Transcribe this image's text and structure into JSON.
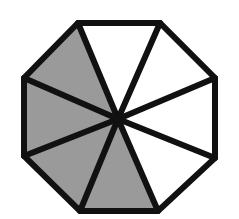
{
  "figure": {
    "shape": "regular-octagon",
    "center": [
      118,
      119
    ],
    "vertices": [
      [
        78,
        23
      ],
      [
        160,
        23
      ],
      [
        215,
        78
      ],
      [
        215,
        158
      ],
      [
        158,
        211
      ],
      [
        80,
        211
      ],
      [
        24,
        156
      ],
      [
        24,
        78
      ]
    ],
    "sectors_total": 8,
    "sectors_shaded": 4,
    "shaded_sector_indices": [
      4,
      5,
      6,
      7
    ],
    "colors": {
      "shaded": "#9a9a9a",
      "unshaded": "#ffffff",
      "stroke": "#111111"
    },
    "stroke_width": 6
  }
}
